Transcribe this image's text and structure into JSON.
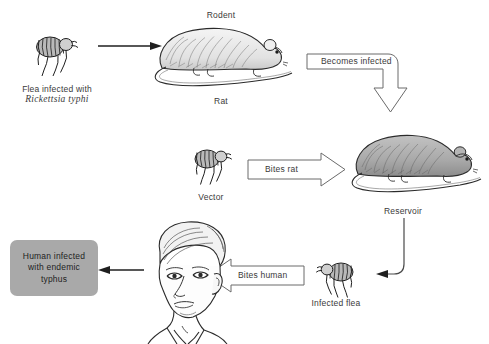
{
  "diagram": {
    "background_color": "#ffffff",
    "gray_box_color": "#a9a9a9",
    "line_color": "#3a3a3a"
  },
  "nodes": {
    "flea_source": {
      "icon": "flea-icon",
      "label_line1": "Flea infected with",
      "label_line2": "Rickettsia typhi"
    },
    "rat_top": {
      "icon": "rat-icon",
      "label_above": "Rodent",
      "label_below": "Rat"
    },
    "flea_vector": {
      "icon": "flea-icon",
      "label": "Vector"
    },
    "rat_reservoir": {
      "icon": "rat-gray-icon",
      "label": "Reservoir"
    },
    "flea_infected": {
      "icon": "flea-icon",
      "label": "Infected flea"
    },
    "human": {
      "icon": "human-head-icon"
    },
    "outcome": {
      "label_line1": "Human infected",
      "label_line2": "with endemic",
      "label_line3": "typhus"
    }
  },
  "arrows": {
    "flea_to_rat": {
      "style": "thin",
      "direction": "right",
      "label": ""
    },
    "becomes_infected": {
      "style": "block-elbow",
      "direction": "right-then-down",
      "label": "Becomes infected"
    },
    "bites_rat": {
      "style": "block",
      "direction": "right",
      "label": "Bites rat"
    },
    "reservoir_to_flea": {
      "style": "thin-elbow",
      "direction": "down-then-left",
      "label": ""
    },
    "bites_human": {
      "style": "block",
      "direction": "left",
      "label": "Bites human"
    },
    "human_to_outcome": {
      "style": "thin",
      "direction": "left",
      "label": ""
    }
  }
}
